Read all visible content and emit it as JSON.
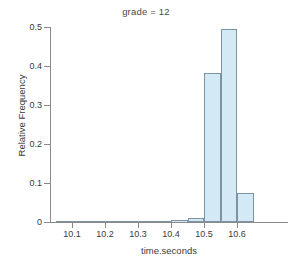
{
  "chart_data": {
    "type": "bar",
    "title": "grade = 12",
    "xlabel": "time.seconds",
    "ylabel": "Relative Frequency",
    "xlim": [
      10.04,
      10.68
    ],
    "ylim": [
      0,
      0.5
    ],
    "grid": false,
    "legend": "none",
    "bin_width": 0.05,
    "xticks": [
      "10.1",
      "10.2",
      "10.3",
      "10.4",
      "10.5",
      "10.6"
    ],
    "xtick_values": [
      10.1,
      10.2,
      10.3,
      10.4,
      10.5,
      10.6
    ],
    "yticks": [
      "0",
      "0.1",
      "0.2",
      "0.3",
      "0.4",
      "0.5"
    ],
    "ytick_values": [
      0,
      0.1,
      0.2,
      0.3,
      0.4,
      0.5
    ],
    "bin_starts": [
      10.05,
      10.1,
      10.15,
      10.2,
      10.25,
      10.3,
      10.35,
      10.4,
      10.45,
      10.5,
      10.55,
      10.6
    ],
    "bin_labels": [
      "10.05-10.10",
      "10.10-10.15",
      "10.15-10.20",
      "10.20-10.25",
      "10.25-10.30",
      "10.30-10.35",
      "10.35-10.40",
      "10.40-10.45",
      "10.45-10.50",
      "10.50-10.55",
      "10.55-10.60",
      "10.60-10.65"
    ],
    "values": [
      0.0,
      0.0,
      0.0,
      0.0,
      0.0,
      0.001,
      0.002,
      0.004,
      0.009,
      0.382,
      0.494,
      0.074
    ],
    "colors": {
      "bar_fill": "#d3eaf6",
      "bar_border": "#7d93a0",
      "axis": "#8a8a8a",
      "text": "#3a3a3a",
      "title": "#4a4a4a",
      "background": "#ffffff"
    }
  }
}
